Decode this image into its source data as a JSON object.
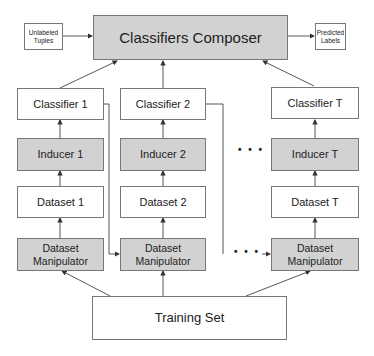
{
  "composer": {
    "label": "Classifiers Composer"
  },
  "input": {
    "label": "Unlabeled Tuples"
  },
  "output": {
    "label": "Predicted Labels"
  },
  "columns": [
    {
      "classifier": "Classifier 1",
      "inducer": "Inducer 1",
      "dataset": "Dataset 1",
      "manipulator": "Dataset Manipulator"
    },
    {
      "classifier": "Classifier 2",
      "inducer": "Inducer 2",
      "dataset": "Dataset 2",
      "manipulator": "Dataset Manipulator"
    },
    {
      "classifier": "Classifier T",
      "inducer": "Inducer T",
      "dataset": "Dataset T",
      "manipulator": "Dataset Manipulator"
    }
  ],
  "ellipsis": {
    "middle": "• • •",
    "bottom": "• • •"
  },
  "training": {
    "label": "Training Set"
  },
  "colors": {
    "gray_fill": "#d2d2d2",
    "border": "#777777",
    "line": "#444444"
  }
}
